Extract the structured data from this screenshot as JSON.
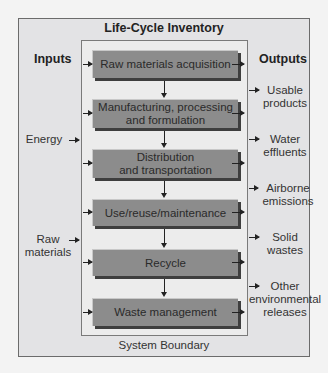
{
  "diagram": {
    "title": "Life-Cycle Inventory",
    "boundary_label": "System Boundary",
    "inputs_header": "Inputs",
    "outputs_header": "Outputs",
    "stages": [
      {
        "label_line1": "Raw materials acquisition",
        "label_line2": ""
      },
      {
        "label_line1": "Manufacturing, processing",
        "label_line2": "and formulation"
      },
      {
        "label_line1": "Distribution",
        "label_line2": "and transportation"
      },
      {
        "label_line1": "Use/reuse/maintenance",
        "label_line2": ""
      },
      {
        "label_line1": "Recycle",
        "label_line2": ""
      },
      {
        "label_line1": "Waste management",
        "label_line2": ""
      }
    ],
    "inputs": [
      {
        "line1": "Energy",
        "line2": ""
      },
      {
        "line1": "Raw",
        "line2": "materials"
      }
    ],
    "outputs": [
      {
        "line1": "Usable",
        "line2": "products",
        "line3": ""
      },
      {
        "line1": "Water",
        "line2": "effluents",
        "line3": ""
      },
      {
        "line1": "Airborne",
        "line2": "emissions",
        "line3": ""
      },
      {
        "line1": "Solid",
        "line2": "wastes",
        "line3": ""
      },
      {
        "line1": "Other",
        "line2": "environmental",
        "line3": "releases"
      }
    ],
    "colors": {
      "background": "#f3f3f3",
      "outer_box": "#e3e3e5",
      "inner_box": "#ececec",
      "stage_fill": "#8c8c8c",
      "stage_shadow": "#3e3e3e",
      "text": "#333333"
    }
  }
}
